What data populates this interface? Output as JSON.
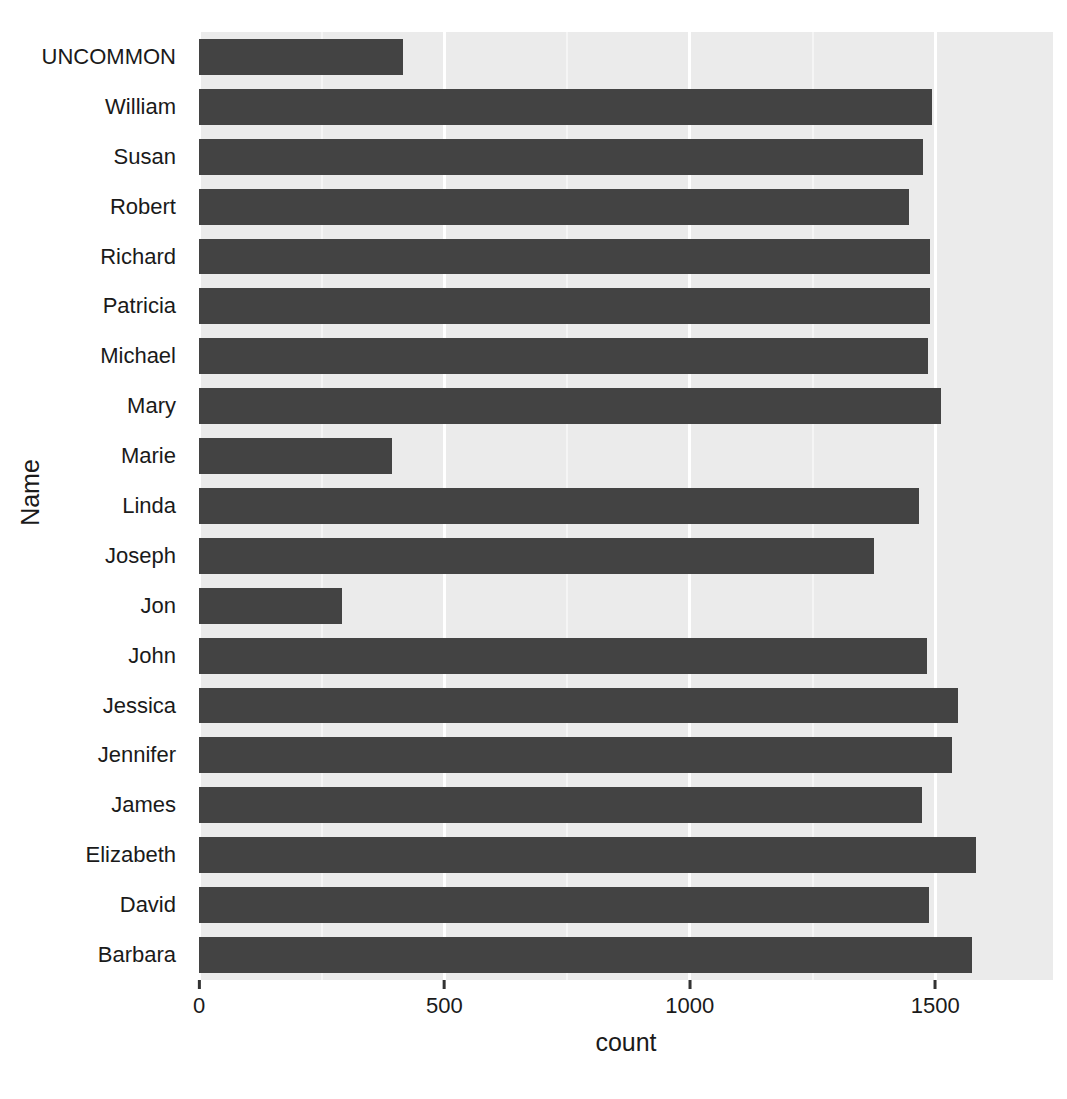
{
  "chart_data": {
    "type": "bar",
    "orientation": "horizontal",
    "title": "",
    "xlabel": "count",
    "ylabel": "Name",
    "xlim": [
      0,
      1740
    ],
    "xticks": [
      0,
      500,
      1000,
      1500
    ],
    "xtick_labels": [
      "0",
      "500",
      "1000",
      "1500"
    ],
    "grid": true,
    "legend": false,
    "bar_color": "#434343",
    "panel_color": "#ebebeb",
    "gridline_color": "#ffffff",
    "categories": [
      "UNCOMMON",
      "William",
      "Susan",
      "Robert",
      "Richard",
      "Patricia",
      "Michael",
      "Mary",
      "Marie",
      "Linda",
      "Joseph",
      "Jon",
      "John",
      "Jessica",
      "Jennifer",
      "James",
      "Elizabeth",
      "David",
      "Barbara"
    ],
    "values": [
      416,
      1493,
      1476,
      1447,
      1490,
      1490,
      1485,
      1512,
      393,
      1467,
      1375,
      291,
      1483,
      1546,
      1534,
      1473,
      1583,
      1487,
      1574
    ]
  }
}
